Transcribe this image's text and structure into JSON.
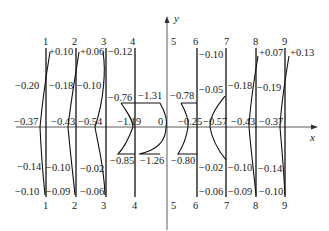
{
  "axes": {
    "x_label": "x",
    "y_label": "y"
  },
  "sections": [
    {
      "id": "1",
      "top": "+0.10",
      "upper": "-0.20",
      "mid": "-0.37",
      "lower": "-0.14",
      "bottom": "-0.10"
    },
    {
      "id": "2",
      "top": "+0.06",
      "upper": "-0.18",
      "mid": "-0.43",
      "lower": "-0.10",
      "bottom": "-0.09"
    },
    {
      "id": "3",
      "top": "-0.12",
      "upper": "-0.10",
      "mid": "-0.54",
      "lower": "-0.02",
      "bottom": "-0.06"
    },
    {
      "id": "4",
      "top": "-0.76",
      "upper": "-1.31",
      "mid": "-1.19",
      "lower": "-0.85",
      "bottom": "-1.26"
    },
    {
      "id": "5",
      "mid": "0"
    },
    {
      "id": "6",
      "top": "-0.78",
      "mid": "-0.25",
      "bottom": "-0.80"
    },
    {
      "id": "7",
      "top": "-0.10",
      "upper": "-0.05",
      "mid": "-0.57",
      "lower": "-0.02",
      "bottom": "-0.06"
    },
    {
      "id": "8",
      "top": "-0.18",
      "upper": "+0.07",
      "mid": "-0.43",
      "lower": "-0.10",
      "bottom": "-0.09"
    },
    {
      "id": "9",
      "top": "-0.19",
      "upper": "+0.13",
      "mid": "-0.37",
      "lower": "-0.14",
      "bottom": "-0.10"
    }
  ],
  "labels": {
    "s1_top": "+0.10",
    "s1_upper": "-0.20",
    "s1_mid": "-0.37",
    "s1_lower": "-0.14",
    "s1_bottom": "-0.10",
    "s2_top": "+0.06",
    "s2_upper": "-0.18",
    "s2_mid": "-0.43",
    "s2_lower": "-0.10",
    "s2_bottom": "-0.09",
    "s3_top": "-0.12",
    "s3_upper": "-0.10",
    "s3_mid": "-0.54",
    "s3_lower": "-0.02",
    "s3_bottom": "-0.06",
    "s4_top_left": "-0.76",
    "s4_top_right": "-1.31",
    "s4_mid": "-1.19",
    "s4_mid_right": "0",
    "s4_bot_left": "-0.85",
    "s4_bot_right": "-1.26",
    "s6_top": "-0.78",
    "s6_mid": "-0.25",
    "s6_bot": "-0.80",
    "s7_top": "-0.10",
    "s7_upper": "-0.05",
    "s7_mid": "-0.57",
    "s7_lower": "-0.02",
    "s7_bottom": "-0.06",
    "s8_upper": "-0.18",
    "s8_top": "+0.07",
    "s8_mid": "-0.43",
    "s8_lower": "-0.10",
    "s8_bottom": "-0.09",
    "s9_upper": "-0.19",
    "s9_top": "+0.13",
    "s9_mid": "-0.37",
    "s9_lower": "-0.14",
    "s9_bottom": "-0.10"
  },
  "section_ids": [
    "1",
    "2",
    "3",
    "4",
    "5",
    "6",
    "7",
    "8",
    "9"
  ]
}
